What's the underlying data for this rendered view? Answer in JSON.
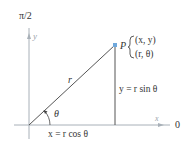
{
  "diagram": {
    "polar_axis_label": "π/2",
    "zero_axis_label": "0",
    "x_axis_label": "x",
    "y_axis_label": "y",
    "point_label": "P",
    "point_coords_rect": "(x, y)",
    "point_coords_polar": "(r, θ)",
    "radius_label": "r",
    "angle_label": "θ",
    "vertical_eq": "y = r sin θ",
    "horizontal_eq": "x = r cos θ"
  },
  "colors": {
    "axis": "#a8b0b8",
    "line": "#444444",
    "point": "#6fa8dc",
    "text": "#333333"
  }
}
